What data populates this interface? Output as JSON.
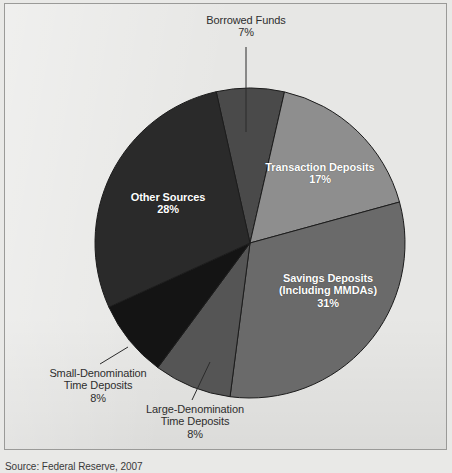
{
  "figure": {
    "background_color": "#e7e7e5",
    "border_color": "#9a9a98",
    "source_note": "Source: Federal Reserve, 2007"
  },
  "chart_data": {
    "type": "pie",
    "title": "",
    "subtitle": "",
    "xlabel": "",
    "ylabel": "",
    "legend_position": "none",
    "grid": false,
    "units": "percent",
    "start_angle_deg": -12.6,
    "direction": "clockwise",
    "center": {
      "x": 250,
      "y": 243
    },
    "radius": 155,
    "categories": [
      "Borrowed Funds",
      "Transaction Deposits",
      "Savings Deposits (Including MMDAs)",
      "Large-Denomination Time Deposits",
      "Small-Denomination Time Deposits",
      "Other Sources"
    ],
    "values": [
      7,
      17,
      31,
      8,
      8,
      28
    ],
    "slices": [
      {
        "name": "Borrowed Funds",
        "label_lines": [
          "Borrowed Funds"
        ],
        "percent_text": "7%",
        "value": 7,
        "color": "#4a4a4a",
        "label_placement": "outside",
        "has_leader_line": true
      },
      {
        "name": "Transaction Deposits",
        "label_lines": [
          "Transaction Deposits"
        ],
        "percent_text": "17%",
        "value": 17,
        "color": "#8e8e8e",
        "label_placement": "inside",
        "has_leader_line": false
      },
      {
        "name": "Savings Deposits",
        "label_lines": [
          "Savings Deposits",
          "(Including MMDAs)"
        ],
        "percent_text": "31%",
        "value": 31,
        "color": "#6a6a6a",
        "label_placement": "inside",
        "has_leader_line": false
      },
      {
        "name": "Large-Denomination Time Deposits",
        "label_lines": [
          "Large-Denomination",
          "Time Deposits"
        ],
        "percent_text": "8%",
        "value": 8,
        "color": "#555555",
        "label_placement": "outside",
        "has_leader_line": true
      },
      {
        "name": "Small-Denomination Time Deposits",
        "label_lines": [
          "Small-Denomination",
          "Time Deposits"
        ],
        "percent_text": "8%",
        "value": 8,
        "color": "#141414",
        "label_placement": "outside",
        "has_leader_line": true
      },
      {
        "name": "Other Sources",
        "label_lines": [
          "Other Sources"
        ],
        "percent_text": "28%",
        "value": 28,
        "color": "#2a2a2a",
        "label_placement": "inside",
        "has_leader_line": false
      }
    ]
  },
  "labels": {
    "borrowed": {
      "line1": "Borrowed Funds",
      "pct": "7%"
    },
    "transaction": {
      "line1": "Transaction Deposits",
      "pct": "17%"
    },
    "savings": {
      "line1": "Savings Deposits",
      "line2": "(Including MMDAs)",
      "pct": "31%"
    },
    "other": {
      "line1": "Other Sources",
      "pct": "28%"
    },
    "small": {
      "line1": "Small-Denomination",
      "line2": "Time Deposits",
      "pct": "8%"
    },
    "large": {
      "line1": "Large-Denomination",
      "line2": "Time Deposits",
      "pct": "8%"
    }
  }
}
